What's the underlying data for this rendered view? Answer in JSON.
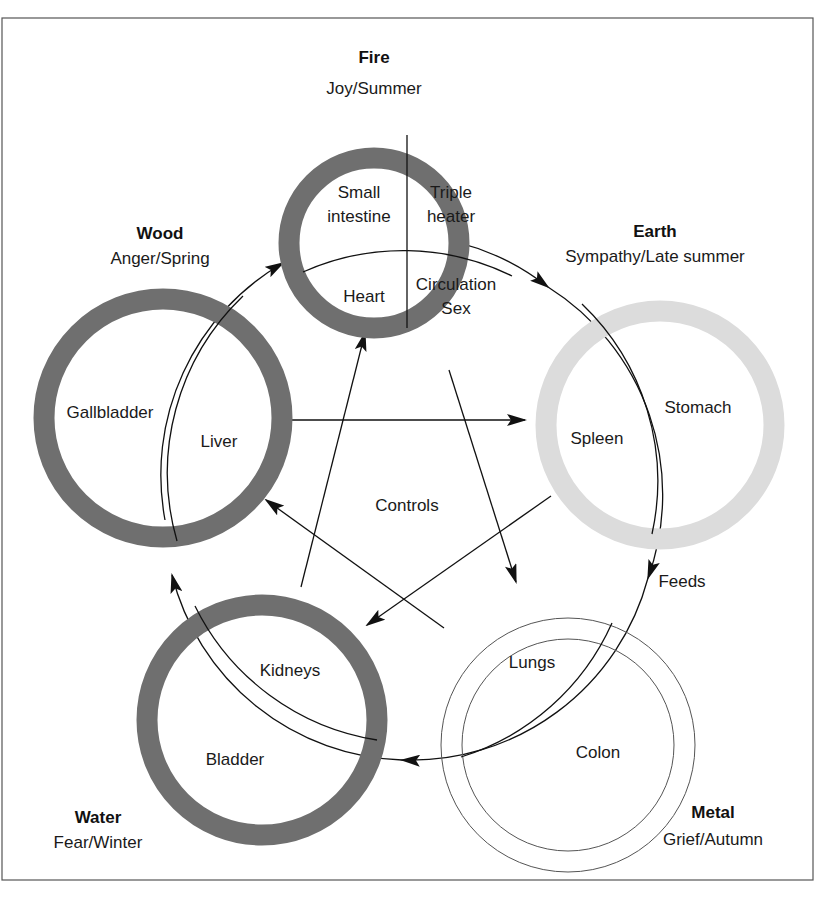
{
  "diagram": {
    "center_label": "Controls",
    "feeds_label": "Feeds",
    "colors": {
      "fire": "#6f6f6f",
      "wood": "#6f6f6f",
      "water": "#6f6f6f",
      "earth": "#dcdcdc",
      "metal_outline": "#555555",
      "line": "#111111",
      "frame": "#555555"
    },
    "elements": {
      "fire": {
        "name": "Fire",
        "emotion_season": "Joy/Summer",
        "organs": [
          "Small",
          "intestine",
          "Triple",
          "heater",
          "Heart",
          "Circulation",
          "Sex"
        ]
      },
      "wood": {
        "name": "Wood",
        "emotion_season": "Anger/Spring",
        "organs": [
          "Gallbladder",
          "Liver"
        ]
      },
      "earth": {
        "name": "Earth",
        "emotion_season": "Sympathy/Late summer",
        "organs": [
          "Stomach",
          "Spleen"
        ]
      },
      "water": {
        "name": "Water",
        "emotion_season": "Fear/Winter",
        "organs": [
          "Kidneys",
          "Bladder"
        ]
      },
      "metal": {
        "name": "Metal",
        "emotion_season": "Grief/Autumn",
        "organs": [
          "Lungs",
          "Colon"
        ]
      }
    },
    "relations": {
      "feeds_cycle": [
        "Wood",
        "Fire",
        "Earth",
        "Metal",
        "Water",
        "Wood"
      ],
      "controls_cycle": [
        [
          "Wood",
          "Earth"
        ],
        [
          "Earth",
          "Water"
        ],
        [
          "Water",
          "Fire"
        ],
        [
          "Fire",
          "Metal"
        ],
        [
          "Metal",
          "Wood"
        ]
      ]
    }
  }
}
